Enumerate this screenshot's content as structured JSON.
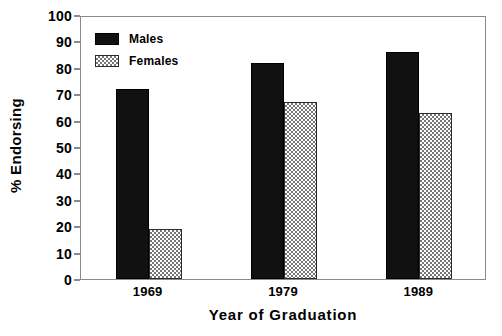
{
  "chart_data": {
    "type": "bar",
    "title": "",
    "xlabel": "Year of Graduation",
    "ylabel": "% Endorsing",
    "categories": [
      "1969",
      "1979",
      "1989"
    ],
    "series": [
      {
        "name": "Males",
        "values": [
          72,
          82,
          86
        ],
        "fill": "solid-black",
        "color": "#111111"
      },
      {
        "name": "Females",
        "values": [
          19,
          67,
          63
        ],
        "fill": "checkerboard-hatch",
        "color": "#777777"
      }
    ],
    "ylim": [
      0,
      100
    ],
    "yticks": [
      0,
      10,
      20,
      30,
      40,
      50,
      60,
      70,
      80,
      90,
      100
    ],
    "ytick_labels": [
      "0",
      "10",
      "20",
      "30",
      "40",
      "50",
      "60",
      "70",
      "80",
      "90",
      "100"
    ],
    "grid": false,
    "legend_position": "top-left-inside",
    "frame": "box",
    "annotations": []
  },
  "legend": {
    "entries": [
      {
        "label": "Males"
      },
      {
        "label": "Females"
      }
    ]
  }
}
